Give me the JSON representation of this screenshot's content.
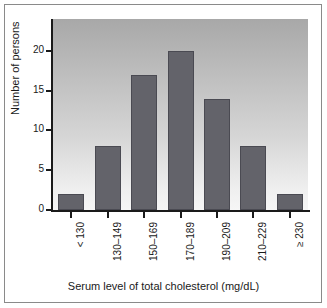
{
  "chart_data": {
    "type": "bar",
    "title": "",
    "subtitle": "",
    "xlabel": "Serum level of total cholesterol (mg/dL)",
    "ylabel": "Number of persons",
    "categories": [
      "< 130",
      "130–149",
      "150–169",
      "170–189",
      "190–209",
      "210–229",
      "≥ 230"
    ],
    "values": [
      2,
      8,
      17,
      20,
      14,
      8,
      2
    ],
    "ylim": [
      0,
      24
    ],
    "yticks": [
      0,
      5,
      10,
      15,
      20
    ],
    "ytick_labels": [
      "0",
      "5",
      "10",
      "15",
      "20"
    ],
    "grid": false,
    "legend": null,
    "bar_color": "#63636a",
    "plot_background": "gradient gray top to white bottom",
    "axis_color": "#1a1a1a",
    "frame_color": "#8a8a8a"
  }
}
